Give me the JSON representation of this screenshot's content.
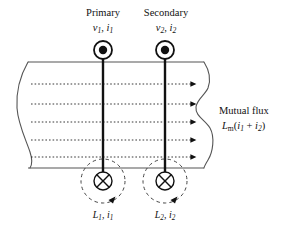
{
  "figure": {
    "type": "transformer-mutual-flux-diagram",
    "background_color": "#ffffff",
    "line_color": "#111111",
    "core_edge_color": "#555555"
  },
  "labels": {
    "primary_title": "Primary",
    "primary_vars_v": "v",
    "primary_vars_v_sub": "1",
    "primary_vars_i": "i",
    "primary_vars_i_sub": "1",
    "primary_vars_sep": ", ",
    "secondary_title": "Secondary",
    "secondary_vars_v": "v",
    "secondary_vars_v_sub": "2",
    "secondary_vars_i": "i",
    "secondary_vars_i_sub": "2",
    "secondary_vars_sep": ", ",
    "mutual_flux_title": "Mutual flux",
    "mutual_flux_L": "L",
    "mutual_flux_L_sub": "m",
    "mutual_flux_expr_open": "(",
    "mutual_flux_i1": "i",
    "mutual_flux_i1_sub": "1",
    "mutual_flux_plus": " + ",
    "mutual_flux_i2": "i",
    "mutual_flux_i2_sub": "2",
    "mutual_flux_expr_close": ")",
    "primary_inductance_L": "L",
    "primary_inductance_L_sub": "1",
    "primary_inductance_sep": ", ",
    "primary_inductance_i": "i",
    "primary_inductance_i_sub": "1",
    "secondary_inductance_L": "L",
    "secondary_inductance_L_sub": "2",
    "secondary_inductance_sep": ", ",
    "secondary_inductance_i": "i",
    "secondary_inductance_i_sub": "2"
  },
  "symbols": {
    "current_out_of_page": "dot-in-circle-icon",
    "current_into_page": "cross-in-circle-icon",
    "flux_direction": "right-arrow-icon",
    "leakage_flux_loop": "dashed-circle-arrow-icon",
    "core_break": "wavy-break-edge"
  },
  "geometry": {
    "core_top_y": 62,
    "core_bottom_y": 168,
    "primary_conductor_x": 103,
    "secondary_conductor_x": 165,
    "flux_line_count": 5,
    "flux_line_y": [
      84,
      105,
      122,
      140,
      157
    ],
    "flux_line_start_x": 30,
    "flux_line_end_x": 198,
    "top_symbol_y": 50,
    "bottom_symbol_y": 180,
    "symbol_radius": 9,
    "dashed_loop_radius": 22
  }
}
